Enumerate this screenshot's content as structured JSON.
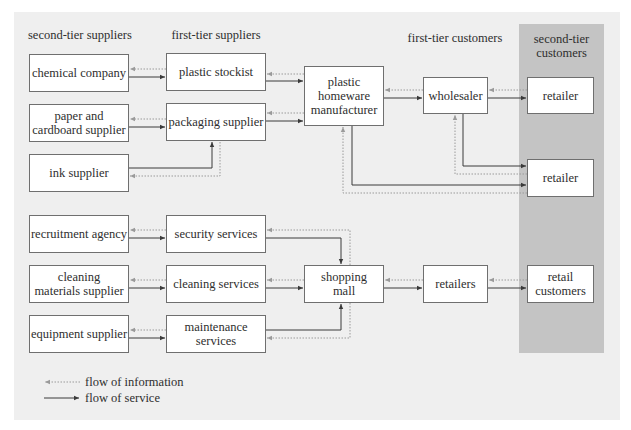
{
  "headers": {
    "second_tier_suppliers": "second-tier suppliers",
    "first_tier_suppliers": "first-tier suppliers",
    "first_tier_customers": "first-tier customers",
    "second_tier_customers": "second-tier\ncustomers"
  },
  "manufacturing_chain": {
    "chemical_company": "chemical company",
    "plastic_stockist": "plastic stockist",
    "paper_cardboard_supplier": "paper and\ncardboard supplier",
    "packaging_supplier": "packaging supplier",
    "ink_supplier": "ink supplier",
    "manufacturer": "plastic\nhomeware\nmanufacturer",
    "wholesaler": "wholesaler",
    "retailer_1": "retailer",
    "retailer_2": "retailer"
  },
  "service_chain": {
    "recruitment_agency": "recruitment agency",
    "security_services": "security services",
    "cleaning_materials_supplier": "cleaning\nmaterials supplier",
    "cleaning_services": "cleaning services",
    "equipment_supplier": "equipment supplier",
    "maintenance_services": "maintenance\nservices",
    "shopping_mall": "shopping\nmall",
    "retailers": "retailers",
    "retail_customers": "retail\ncustomers"
  },
  "legend": {
    "information": "flow of information",
    "service": "flow of service"
  },
  "colors": {
    "panel_background": "#efefef",
    "second_tier_customer_band": "#c4c4c4",
    "service_flow_line": "#3a3a3a",
    "information_flow_line": "#9a9a9a"
  }
}
